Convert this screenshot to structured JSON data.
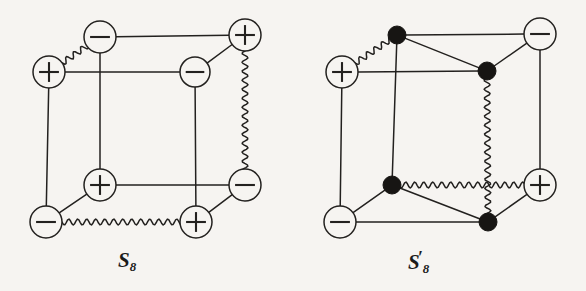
{
  "figure": {
    "background_color": "#f6f4f1",
    "ink_color": "#23211f",
    "caption_left": "S",
    "caption_left_sub": "8",
    "caption_right": "S",
    "caption_right_prime": "′",
    "caption_right_sub": "8",
    "node_fill_open": "#f6f4f1",
    "node_fill_solid": "#171513"
  },
  "chart_data": {
    "type": "diagram",
    "title": "",
    "graphs": [
      {
        "name": "S8",
        "label": "S_8",
        "label_position": {
          "x": 118,
          "y": 248
        },
        "vertices": [
          {
            "id": "btl",
            "label": "−",
            "style": "open-circle",
            "x": 100,
            "y": 37,
            "r": 16
          },
          {
            "id": "btr",
            "label": "+",
            "style": "open-circle",
            "x": 245,
            "y": 35,
            "r": 16
          },
          {
            "id": "ftl",
            "label": "+",
            "style": "open-circle",
            "x": 49,
            "y": 72,
            "r": 16
          },
          {
            "id": "ftr",
            "label": "−",
            "style": "open-circle",
            "x": 195,
            "y": 72,
            "r": 15
          },
          {
            "id": "bbl",
            "label": "+",
            "style": "open-circle",
            "x": 100,
            "y": 185,
            "r": 16
          },
          {
            "id": "bbr",
            "label": "−",
            "style": "open-circle",
            "x": 245,
            "y": 185,
            "r": 16
          },
          {
            "id": "fbl",
            "label": "−",
            "style": "open-circle",
            "x": 46,
            "y": 222,
            "r": 16
          },
          {
            "id": "fbr",
            "label": "+",
            "style": "open-circle",
            "x": 196,
            "y": 222,
            "r": 16
          }
        ],
        "edges": [
          {
            "from": "btl",
            "to": "btr",
            "kind": "straight"
          },
          {
            "from": "ftl",
            "to": "ftr",
            "kind": "straight"
          },
          {
            "from": "bbl",
            "to": "bbr",
            "kind": "straight"
          },
          {
            "from": "fbl",
            "to": "fbr",
            "kind": "wavy"
          },
          {
            "from": "btl",
            "to": "bbl",
            "kind": "straight"
          },
          {
            "from": "btr",
            "to": "bbr",
            "kind": "wavy"
          },
          {
            "from": "ftl",
            "to": "fbl",
            "kind": "straight"
          },
          {
            "from": "ftr",
            "to": "fbr",
            "kind": "straight"
          },
          {
            "from": "ftl",
            "to": "btl",
            "kind": "wavy"
          },
          {
            "from": "ftr",
            "to": "btr",
            "kind": "straight"
          },
          {
            "from": "fbl",
            "to": "bbl",
            "kind": "straight"
          },
          {
            "from": "fbr",
            "to": "bbr",
            "kind": "straight"
          }
        ],
        "wavy_edge_count": 3
      },
      {
        "name": "S8prime",
        "label": "S'_8",
        "label_position": {
          "x": 408,
          "y": 248
        },
        "vertices": [
          {
            "id": "btl",
            "label": "",
            "style": "solid-dot",
            "x": 397,
            "y": 35,
            "r": 9
          },
          {
            "id": "btr",
            "label": "−",
            "style": "open-circle",
            "x": 540,
            "y": 34,
            "r": 16
          },
          {
            "id": "ftl",
            "label": "+",
            "style": "open-circle",
            "x": 342,
            "y": 72,
            "r": 16
          },
          {
            "id": "ftr",
            "label": "",
            "style": "solid-dot",
            "x": 487,
            "y": 71,
            "r": 9
          },
          {
            "id": "bbl",
            "label": "",
            "style": "solid-dot",
            "x": 392,
            "y": 185,
            "r": 9
          },
          {
            "id": "bbr",
            "label": "+",
            "style": "open-circle",
            "x": 540,
            "y": 185,
            "r": 16
          },
          {
            "id": "fbl",
            "label": "−",
            "style": "open-circle",
            "x": 340,
            "y": 222,
            "r": 16
          },
          {
            "id": "fbr",
            "label": "",
            "style": "solid-dot",
            "x": 488,
            "y": 222,
            "r": 9
          }
        ],
        "edges": [
          {
            "from": "btl",
            "to": "btr",
            "kind": "straight"
          },
          {
            "from": "ftl",
            "to": "ftr",
            "kind": "straight"
          },
          {
            "from": "bbl",
            "to": "bbr",
            "kind": "wavy"
          },
          {
            "from": "fbl",
            "to": "fbr",
            "kind": "straight"
          },
          {
            "from": "btl",
            "to": "bbl",
            "kind": "straight"
          },
          {
            "from": "btr",
            "to": "bbr",
            "kind": "straight"
          },
          {
            "from": "ftl",
            "to": "fbl",
            "kind": "straight"
          },
          {
            "from": "ftr",
            "to": "fbr",
            "kind": "wavy"
          },
          {
            "from": "ftl",
            "to": "btl",
            "kind": "wavy"
          },
          {
            "from": "ftr",
            "to": "btr",
            "kind": "straight"
          },
          {
            "from": "fbl",
            "to": "bbl",
            "kind": "straight"
          },
          {
            "from": "fbr",
            "to": "bbr",
            "kind": "straight"
          },
          {
            "from": "btl",
            "to": "ftr",
            "kind": "straight"
          },
          {
            "from": "bbl",
            "to": "fbr",
            "kind": "straight"
          }
        ],
        "wavy_edge_count": 3
      }
    ]
  }
}
